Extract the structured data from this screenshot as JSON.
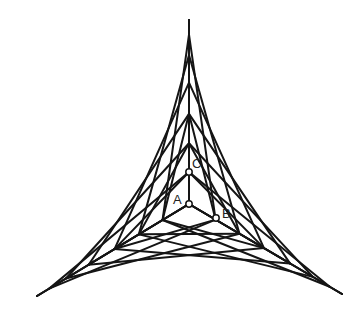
{
  "diagram": {
    "center": {
      "x": 189,
      "y": 204
    },
    "spines": {
      "up": {
        "tip": {
          "x": 189,
          "y": 20
        }
      },
      "right": {
        "tip": {
          "x": 342,
          "y": 294
        }
      },
      "left": {
        "tip": {
          "x": 37,
          "y": 296
        }
      }
    },
    "spine_fractions": [
      0,
      0.174,
      0.33,
      0.49,
      0.66,
      0.81,
      0.92,
      1.0
    ],
    "line_color": "#151515",
    "points": [
      {
        "label": "A",
        "x": 189,
        "y": 204,
        "label_dx": -16,
        "label_dy": 0
      },
      {
        "label": "B",
        "x": 216,
        "y": 218,
        "label_dx": 6,
        "label_dy": 0
      },
      {
        "label": "C",
        "x": 189,
        "y": 172,
        "label_dx": 3,
        "label_dy": -4
      }
    ]
  }
}
